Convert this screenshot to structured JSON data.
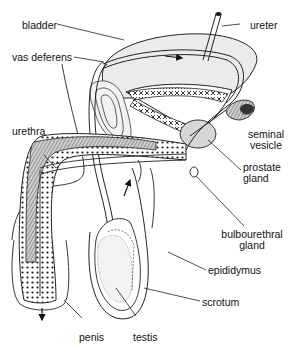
{
  "diagram": {
    "type": "anatomical-diagram",
    "labels": {
      "bladder": "bladder",
      "ureter": "ureter",
      "vas_deferens": "vas deferens",
      "urethra": "urethra",
      "seminal_vesicle_1": "seminal",
      "seminal_vesicle_2": "vesicle",
      "prostate_gland_1": "prostate",
      "prostate_gland_2": "gland",
      "bulbourethral_gland_1": "bulbourethral",
      "bulbourethral_gland_2": "gland",
      "epididymus": "epididymus",
      "scrotum": "scrotum",
      "penis": "penis",
      "testis": "testis"
    },
    "colors": {
      "line": "#1a1a1a",
      "shade": "#8a8a8a",
      "background": "#ffffff"
    }
  }
}
